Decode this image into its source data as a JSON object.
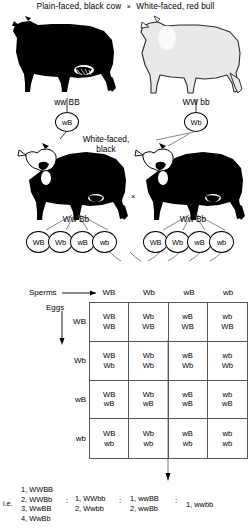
{
  "parents": {
    "cross_symbol": "×",
    "left": {
      "phenotype": "Plain-faced, black cow",
      "genotype": "ww BB",
      "gamete": "wB",
      "coat_color": "#000000"
    },
    "right": {
      "phenotype": "White-faced, red bull",
      "genotype": "WW bb",
      "gamete": "Wb",
      "coat_color": "#e8e8e8"
    }
  },
  "f1": {
    "phenotype_line1": "White-faced,",
    "phenotype_line2": "black",
    "cross_symbol": "×",
    "left_genotype": "Ww Bb",
    "right_genotype": "Ww Bb",
    "left_gametes": [
      "WB",
      "Wb",
      "wB",
      "wb"
    ],
    "right_gametes": [
      "WB",
      "Wb",
      "wB",
      "wb"
    ]
  },
  "punnett": {
    "sperms_label": "Sperms",
    "eggs_label": "Eggs",
    "columns": [
      "WB",
      "Wb",
      "wB",
      "wb"
    ],
    "rows": [
      "WB",
      "Wb",
      "wB",
      "wb"
    ],
    "cells": [
      [
        [
          "WB",
          "WB"
        ],
        [
          "Wb",
          "WB"
        ],
        [
          "wB",
          "WB"
        ],
        [
          "wb",
          "WB"
        ]
      ],
      [
        [
          "WB",
          "Wb"
        ],
        [
          "Wb",
          "Wb"
        ],
        [
          "wB",
          "Wb"
        ],
        [
          "wb",
          "Wb"
        ]
      ],
      [
        [
          "WB",
          "wB"
        ],
        [
          "Wb",
          "wB"
        ],
        [
          "wB",
          "wB"
        ],
        [
          "wb",
          "wB"
        ]
      ],
      [
        [
          "WB",
          "wb"
        ],
        [
          "Wb",
          "wb"
        ],
        [
          "wB",
          "wb"
        ],
        [
          "wb",
          "wb"
        ]
      ]
    ]
  },
  "ratio": {
    "prefix": "i.e.",
    "separator": ":",
    "group1": [
      "1, WWBB",
      "2, WWBb",
      "3, WwBB",
      "4, WwBb"
    ],
    "group2": [
      "1, WWbb",
      "2, Wwbb"
    ],
    "group3": [
      "1, wwBB",
      "2, wwBb"
    ],
    "group4": [
      "1, wwbb"
    ]
  }
}
